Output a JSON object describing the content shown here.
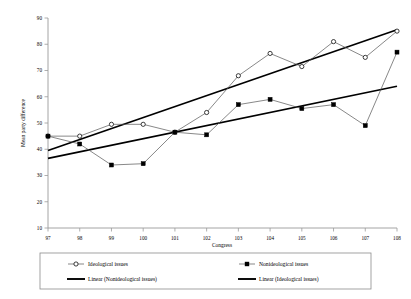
{
  "chart_data": {
    "type": "line",
    "title": "",
    "xlabel": "Congress",
    "ylabel": "Mean party difference",
    "categories": [
      97,
      98,
      99,
      100,
      101,
      102,
      103,
      104,
      105,
      106,
      107,
      108
    ],
    "xlim": [
      97,
      108
    ],
    "ylim": [
      10,
      90
    ],
    "yticks": [
      10,
      20,
      30,
      40,
      50,
      60,
      70,
      80,
      90
    ],
    "xticks": [
      97,
      98,
      99,
      100,
      101,
      102,
      103,
      104,
      105,
      106,
      107,
      108
    ],
    "grid": false,
    "legend_position": "bottom",
    "series": [
      {
        "name": "Ideological issues",
        "marker": "open-circle",
        "values": [
          45.0,
          45.0,
          49.5,
          49.5,
          46.5,
          54.0,
          68.0,
          76.5,
          71.5,
          81.0,
          75.0,
          85.0
        ]
      },
      {
        "name": "Nonideological issues",
        "marker": "filled-square",
        "values": [
          45.0,
          42.0,
          34.0,
          34.5,
          46.5,
          45.5,
          57.0,
          59.0,
          55.5,
          57.0,
          49.0,
          77.0
        ]
      }
    ],
    "trendlines": [
      {
        "name": "Linear (Nonideological issues)",
        "x": [
          97,
          108
        ],
        "y": [
          36.5,
          64.0
        ]
      },
      {
        "name": "Linear (Ideological issues)",
        "x": [
          97,
          108
        ],
        "y": [
          39.5,
          85.5
        ]
      }
    ]
  },
  "legend": {
    "items": [
      {
        "label": "Ideological issues",
        "marker": "open-circle"
      },
      {
        "label": "Nonideological issues",
        "marker": "filled-square"
      },
      {
        "label": "Linear (Nonideological issues)",
        "marker": "thick-line"
      },
      {
        "label": "Linear (Ideological issues)",
        "marker": "thick-line"
      }
    ]
  },
  "axes": {
    "x_title": "Congress",
    "y_title": "Mean party difference"
  }
}
